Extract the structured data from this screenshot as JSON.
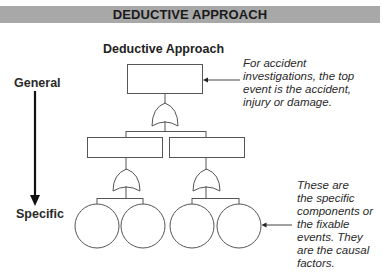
{
  "banner": {
    "title": "DEDUCTIVE APPROACH"
  },
  "diagram": {
    "title": "Deductive Approach",
    "axis": {
      "top_label": "General",
      "bottom_label": "Specific"
    },
    "notes": {
      "top_event": "For accident investigations, the top event is the accident, injury or damage.",
      "top_event_lines": [
        "For accident",
        "investigations, the top",
        "event is the accident,",
        "injury or damage."
      ],
      "basic_events_lines": [
        "These are",
        "the specific",
        "components or",
        "the fixable",
        "events. They",
        "are the causal",
        "factors."
      ]
    },
    "structure": {
      "top_event": 1,
      "gates": [
        {
          "type": "OR",
          "level": 1
        },
        {
          "type": "OR",
          "level": 2
        },
        {
          "type": "OR",
          "level": 2
        }
      ],
      "intermediate_events": 2,
      "basic_events": 4
    },
    "colors": {
      "banner": "#a8a8a8",
      "stroke": "#555555",
      "text": "#222222"
    }
  }
}
